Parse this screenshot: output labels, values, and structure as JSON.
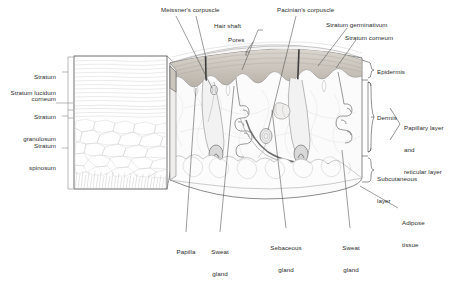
{
  "figure": {
    "background_color": "#ffffff",
    "text_color": "#2b2b2b",
    "line_color": "#4a4a4a",
    "epidermis_band_color": "#c9c3bb",
    "dermis_fill_color": "#f4f4f5",
    "adipose_fill_color": "#fafafa"
  },
  "inset": {
    "name": "epidermis-magnification-inset",
    "labels": [
      {
        "id": "stratum-corneum",
        "text": "Stratum\ncorneum",
        "line1": "Stratum",
        "line2": "corneum"
      },
      {
        "id": "stratum-lucidum",
        "text": "Stratum lucidum",
        "line1": "Stratum lucidum",
        "line2": ""
      },
      {
        "id": "stratum-granulosum",
        "text": "Stratum\ngranulosum",
        "line1": "Stratum",
        "line2": "granulosum"
      },
      {
        "id": "stratum-spinosum",
        "text": "Stratum\nspinosum",
        "line1": "Stratum",
        "line2": "spinosum"
      }
    ]
  },
  "top_labels": [
    {
      "id": "meissners-corpuscle",
      "text": "Meissner's corpuscle"
    },
    {
      "id": "hair-shaft",
      "text": "Hair shaft"
    },
    {
      "id": "pores",
      "text": "Pores"
    },
    {
      "id": "pacinians-corpuscle",
      "text": "Pacinian's corpuscle"
    },
    {
      "id": "stratum-germinativum",
      "text": "Stratum germinativum"
    },
    {
      "id": "stratum-corneum-main",
      "text": "Stratum corneum"
    }
  ],
  "right_labels": [
    {
      "id": "epidermis",
      "text": "Epidermis"
    },
    {
      "id": "dermis",
      "text": "Dermis"
    },
    {
      "id": "papillary-reticular",
      "line1": "Papillary layer",
      "line2": "and",
      "line3": "reticular layer"
    },
    {
      "id": "subcutaneous-layer",
      "line1": "Subcutaneous",
      "line2": "layer"
    },
    {
      "id": "adipose-tissue",
      "line1": "Adipose",
      "line2": "tissue"
    }
  ],
  "bottom_labels": [
    {
      "id": "papilla",
      "line1": "Papilla",
      "line2": ""
    },
    {
      "id": "sweat-gland-left",
      "line1": "Sweat",
      "line2": "gland"
    },
    {
      "id": "sebaceous-gland",
      "line1": "Sebaceous",
      "line2": "gland"
    },
    {
      "id": "sweat-gland-right",
      "line1": "Sweat",
      "line2": "gland"
    }
  ]
}
